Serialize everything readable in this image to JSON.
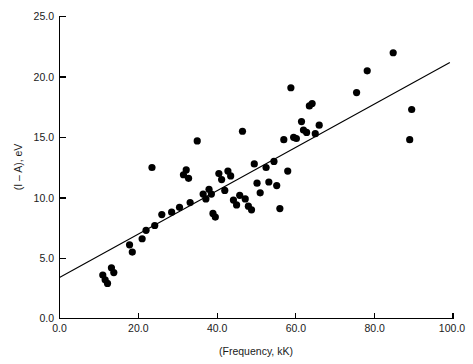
{
  "chart_data": {
    "type": "scatter",
    "title": "",
    "xlabel": "(Frequency, kK)",
    "ylabel": "(I – A), eV",
    "xlim": [
      0.0,
      100.0
    ],
    "ylim": [
      0.0,
      25.0
    ],
    "grid": false,
    "legend": null,
    "xticks": [
      "0.0",
      "20.0",
      "40.0",
      "60.0",
      "80.0",
      "100.0"
    ],
    "xtick_values": [
      0.0,
      20.0,
      40.0,
      60.0,
      80.0,
      100.0
    ],
    "yticks": [
      "0.0",
      "5.0",
      "10.0",
      "15.0",
      "20.0",
      "25.0"
    ],
    "ytick_values": [
      0.0,
      5.0,
      10.0,
      15.0,
      20.0,
      25.0
    ],
    "marker": "filled-circle",
    "marker_color": "#000000",
    "points": [
      {
        "x": 11.0,
        "y": 3.6
      },
      {
        "x": 11.6,
        "y": 3.2
      },
      {
        "x": 12.2,
        "y": 2.9
      },
      {
        "x": 13.2,
        "y": 4.2
      },
      {
        "x": 13.8,
        "y": 3.8
      },
      {
        "x": 17.8,
        "y": 6.1
      },
      {
        "x": 18.5,
        "y": 5.5
      },
      {
        "x": 21.0,
        "y": 6.6
      },
      {
        "x": 22.0,
        "y": 7.3
      },
      {
        "x": 23.5,
        "y": 12.5
      },
      {
        "x": 24.2,
        "y": 7.7
      },
      {
        "x": 26.0,
        "y": 8.6
      },
      {
        "x": 28.5,
        "y": 8.8
      },
      {
        "x": 30.5,
        "y": 9.2
      },
      {
        "x": 31.5,
        "y": 11.9
      },
      {
        "x": 32.2,
        "y": 12.3
      },
      {
        "x": 32.8,
        "y": 11.6
      },
      {
        "x": 33.2,
        "y": 9.6
      },
      {
        "x": 35.0,
        "y": 14.7
      },
      {
        "x": 36.5,
        "y": 10.3
      },
      {
        "x": 37.2,
        "y": 9.9
      },
      {
        "x": 38.0,
        "y": 10.7
      },
      {
        "x": 38.6,
        "y": 10.3
      },
      {
        "x": 39.0,
        "y": 8.7
      },
      {
        "x": 39.6,
        "y": 8.4
      },
      {
        "x": 40.5,
        "y": 12.0
      },
      {
        "x": 41.2,
        "y": 11.5
      },
      {
        "x": 42.0,
        "y": 10.6
      },
      {
        "x": 42.8,
        "y": 12.2
      },
      {
        "x": 43.5,
        "y": 11.8
      },
      {
        "x": 44.2,
        "y": 9.8
      },
      {
        "x": 45.0,
        "y": 9.4
      },
      {
        "x": 45.8,
        "y": 10.2
      },
      {
        "x": 46.5,
        "y": 15.5
      },
      {
        "x": 47.2,
        "y": 9.9
      },
      {
        "x": 48.0,
        "y": 9.3
      },
      {
        "x": 48.8,
        "y": 9.0
      },
      {
        "x": 49.5,
        "y": 12.8
      },
      {
        "x": 50.2,
        "y": 11.2
      },
      {
        "x": 51.0,
        "y": 10.4
      },
      {
        "x": 52.5,
        "y": 12.5
      },
      {
        "x": 53.2,
        "y": 11.3
      },
      {
        "x": 54.5,
        "y": 13.0
      },
      {
        "x": 55.2,
        "y": 11.0
      },
      {
        "x": 56.0,
        "y": 9.1
      },
      {
        "x": 57.0,
        "y": 14.8
      },
      {
        "x": 58.0,
        "y": 12.2
      },
      {
        "x": 58.8,
        "y": 19.1
      },
      {
        "x": 59.5,
        "y": 15.0
      },
      {
        "x": 60.2,
        "y": 14.9
      },
      {
        "x": 61.5,
        "y": 16.3
      },
      {
        "x": 62.0,
        "y": 15.6
      },
      {
        "x": 62.8,
        "y": 15.4
      },
      {
        "x": 63.5,
        "y": 17.6
      },
      {
        "x": 64.2,
        "y": 17.8
      },
      {
        "x": 65.0,
        "y": 15.3
      },
      {
        "x": 66.0,
        "y": 16.0
      },
      {
        "x": 75.5,
        "y": 18.7
      },
      {
        "x": 78.2,
        "y": 20.5
      },
      {
        "x": 84.8,
        "y": 22.0
      },
      {
        "x": 89.5,
        "y": 17.3
      },
      {
        "x": 89.0,
        "y": 14.8
      }
    ],
    "fit_line": {
      "type": "linear-fit",
      "x_start": 0.0,
      "y_start": 3.4,
      "x_end": 99.2,
      "y_end": 21.2
    }
  }
}
